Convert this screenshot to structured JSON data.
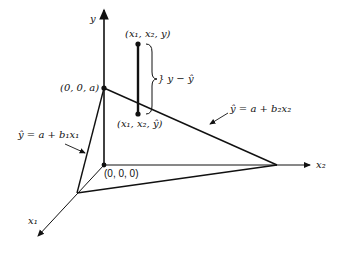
{
  "diagram": {
    "axes": {
      "y": "y",
      "x1": "x₁",
      "x2": "x₂"
    },
    "points": {
      "intercept": "(0, 0, a)",
      "origin": "(0, 0, 0)",
      "observed": "(x₁, x₂, y)",
      "predicted": "(x₁, x₂, ŷ)"
    },
    "residual_label": "} y − ŷ",
    "lines": {
      "line_x1": "ŷ = a + b₁x₁",
      "line_x2": "ŷ = a + b₂x₂"
    }
  }
}
